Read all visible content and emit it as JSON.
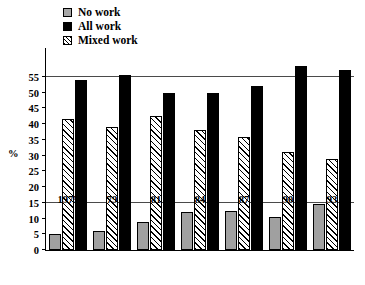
{
  "chart_data": {
    "type": "bar",
    "title": "",
    "xlabel": "",
    "ylabel": "%",
    "ylim": [
      0,
      60
    ],
    "yticks": [
      0,
      5,
      10,
      15,
      20,
      25,
      30,
      35,
      40,
      45,
      50,
      55
    ],
    "gridlines": [
      15,
      55
    ],
    "grid": true,
    "legend_position": "top-left",
    "categories": [
      "1975",
      "79",
      "81",
      "84",
      "87",
      "90",
      "93"
    ],
    "series": [
      {
        "name": "No work",
        "color": "#a0a0a0",
        "pattern": "solid-gray",
        "values": [
          5,
          6,
          9,
          12,
          12.5,
          10.5,
          14.5
        ]
      },
      {
        "name": "Mixed work",
        "color": "#000000",
        "pattern": "diagonal-hatch",
        "values": [
          41.5,
          39,
          42.5,
          38,
          36,
          31,
          29
        ]
      },
      {
        "name": "All work",
        "color": "#000000",
        "pattern": "solid-black",
        "values": [
          54,
          55.5,
          50,
          50,
          52,
          58.5,
          57
        ]
      }
    ]
  },
  "legend": {
    "items": [
      {
        "label": "No work",
        "swatch": "nowork-swatch"
      },
      {
        "label": "All work",
        "swatch": "allwork-swatch"
      },
      {
        "label": "Mixed work",
        "swatch": "mixed-swatch"
      }
    ]
  },
  "axis": {
    "y_title": "%",
    "y_tick_labels": [
      "0",
      "5",
      "10",
      "15",
      "20",
      "25",
      "30",
      "35",
      "40",
      "45",
      "50",
      "55"
    ],
    "x_tick_labels": [
      "1975",
      "79",
      "81",
      "84",
      "87",
      "90",
      "93"
    ]
  }
}
